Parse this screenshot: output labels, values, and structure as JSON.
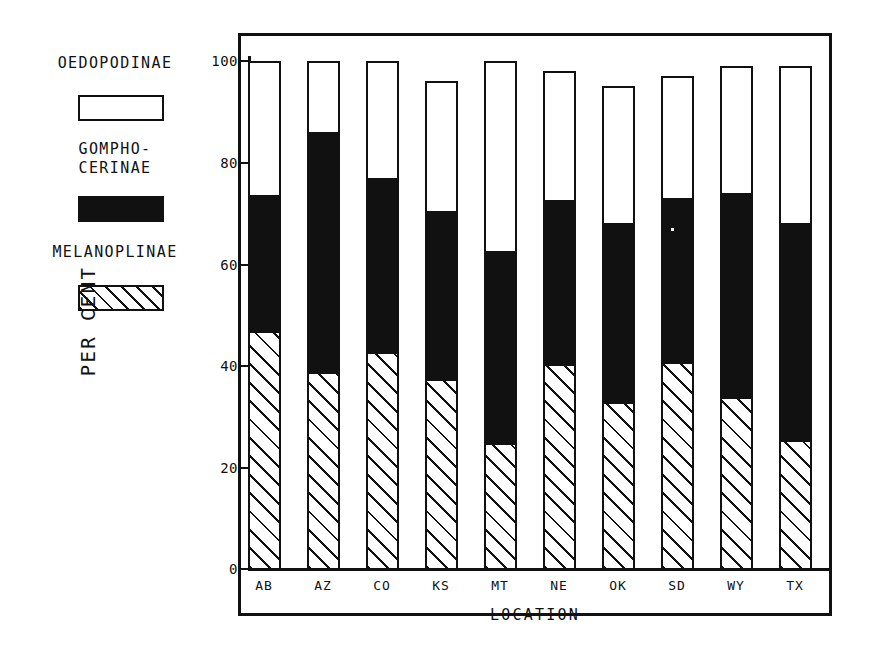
{
  "chart_data": {
    "type": "bar",
    "subtype": "stacked-percentage",
    "title": "",
    "xlabel": "LOCATION",
    "ylabel": "PER CENT",
    "ylim": [
      0,
      100
    ],
    "yticks": [
      0,
      20,
      40,
      60,
      80,
      100
    ],
    "ytick_labels": [
      "0",
      "20",
      "40",
      "60",
      "80",
      "100"
    ],
    "grid": false,
    "legend_position": "upper-left-outside",
    "categories": [
      "AB",
      "AZ",
      "CO",
      "KS",
      "MT",
      "NE",
      "OK",
      "SD",
      "WY",
      "TX"
    ],
    "series": [
      {
        "name": "MELANOPLINAE",
        "fill": "hatched",
        "values": [
          46.5,
          38.5,
          42.5,
          37.0,
          24.5,
          40.0,
          32.5,
          40.5,
          33.5,
          25.0
        ]
      },
      {
        "name": "GOMPHOCERINAE",
        "fill": "solid-black",
        "values": [
          27.0,
          47.5,
          34.5,
          33.5,
          38.0,
          32.5,
          35.5,
          32.5,
          40.5,
          43.0
        ]
      },
      {
        "name": "OEDOPODINAE",
        "fill": "open-white",
        "values": [
          26.5,
          14.0,
          23.0,
          25.5,
          37.5,
          25.5,
          27.0,
          24.0,
          25.0,
          31.0
        ]
      }
    ],
    "cumulative_tops": {
      "melanoplinae": [
        46.5,
        38.5,
        42.5,
        37.0,
        24.5,
        40.0,
        32.5,
        40.5,
        33.5,
        25.0
      ],
      "gomphocerinae": [
        73.5,
        86.0,
        77.0,
        70.5,
        62.5,
        72.5,
        68.0,
        73.0,
        74.0,
        68.0
      ],
      "total": [
        100.0,
        100.0,
        100.0,
        96.0,
        100.0,
        98.0,
        95.0,
        97.0,
        99.0,
        99.0
      ]
    }
  },
  "legend": {
    "entries": [
      {
        "label": "OEDOPODINAE",
        "swatch": "open-white-rectangle"
      },
      {
        "label": "GOMPHO-\nCERINAE",
        "swatch": "solid-black-rectangle"
      },
      {
        "label": "MELANOPLINAE",
        "swatch": "hatched-rectangle"
      }
    ]
  },
  "axes": {
    "y_title": "PER CENT",
    "x_title": "LOCATION",
    "y_tick_labels": [
      "100",
      "80",
      "60",
      "40",
      "20",
      "0"
    ],
    "x_tick_labels": [
      "AB",
      "AZ",
      "CO",
      "KS",
      "MT",
      "NE",
      "OK",
      "SD",
      "WY",
      "TX"
    ]
  },
  "colors": {
    "ink": "#111111",
    "paper": "#ffffff"
  }
}
